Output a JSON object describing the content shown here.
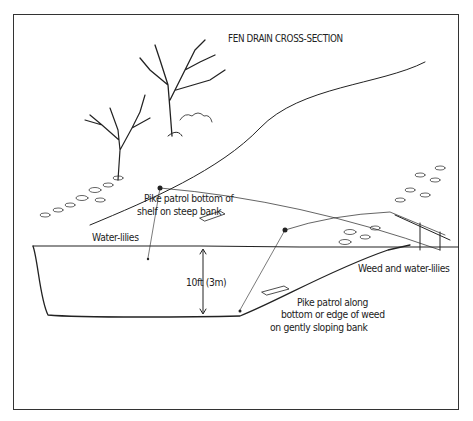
{
  "diagram": {
    "title": "FEN DRAIN CROSS-SECTION",
    "labels": {
      "steep_bank_line1": "Pike patrol bottom of",
      "steep_bank_line2": "shelf on steep bank",
      "water_lilies_left": "Water-lilies",
      "depth": "10ft (3m)",
      "weed_lilies_right": "Weed and water-lilies",
      "gentle_bank_line1": "Pike patrol along",
      "gentle_bank_line2": "bottom or edge of weed",
      "gentle_bank_line3": "on gently sloping bank"
    },
    "colors": {
      "ink": "#222222",
      "background": "#ffffff"
    }
  }
}
